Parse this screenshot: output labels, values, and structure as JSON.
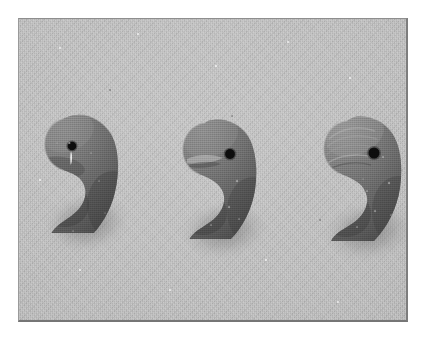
{
  "document": {
    "type": "photographic-plate",
    "medium": "halftone scan",
    "page_background": "#ffffff",
    "plate_border_color": "#8a8a8a"
  },
  "photo": {
    "subject": "three comma-shaped pierced beads (magatama)",
    "background_color": "#b4b4b4",
    "object_color": "#5a5a5a",
    "object_highlight_color": "#8c8c8c",
    "object_shadow_color": "#3a3a3a",
    "perforation_color": "#0d0d0d",
    "cast_shadow_color": "#8e8e8e",
    "lighting": "upper-left",
    "frame": {
      "left": 18,
      "top": 18,
      "width": 390,
      "height": 304
    }
  },
  "objects": [
    {
      "name": "bead-left",
      "label": "Left comma-shaped bead",
      "x": 30,
      "y": 96,
      "width": 76,
      "height": 128,
      "hole": {
        "cx": 53,
        "cy": 127,
        "r": 4.2
      },
      "highlight": "vertical white glint below perforation",
      "size_rank": "smallest"
    },
    {
      "name": "bead-center",
      "label": "Center comma-shaped bead",
      "x": 167,
      "y": 100,
      "width": 78,
      "height": 130,
      "hole": {
        "cx": 211,
        "cy": 135,
        "r": 4.8
      },
      "highlight": "crescent sheen across head",
      "size_rank": "medium"
    },
    {
      "name": "bead-right",
      "label": "Right comma-shaped bead",
      "x": 308,
      "y": 98,
      "width": 82,
      "height": 134,
      "hole": {
        "cx": 355,
        "cy": 134,
        "r": 5.4
      },
      "highlight": "ridged striations over head",
      "size_rank": "largest"
    }
  ]
}
